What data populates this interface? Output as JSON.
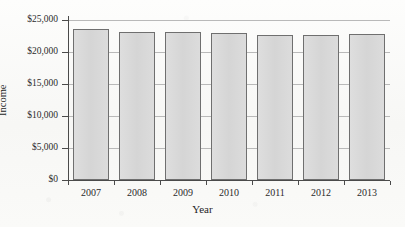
{
  "figure": {
    "cropped_header_text": "",
    "background_color": "#fbfbfa",
    "bar_fill_color": "#d9d9d9",
    "bar_border_color": "#6f6f6f",
    "gridline_color": "#b9b9b9",
    "axis_color": "#4a4a4a"
  },
  "chart_data": {
    "type": "bar",
    "title": "",
    "xlabel": "Year",
    "ylabel": "Income",
    "categories": [
      "2007",
      "2008",
      "2009",
      "2010",
      "2011",
      "2012",
      "2013"
    ],
    "values": [
      23600,
      23100,
      23200,
      22900,
      22700,
      22700,
      22800
    ],
    "ylim": [
      0,
      25000
    ],
    "ytick_values": [
      0,
      5000,
      10000,
      15000,
      20000,
      25000
    ],
    "ytick_labels": [
      "$0",
      "$5,000",
      "$10,000",
      "$15,000",
      "$20,000",
      "$25,000"
    ],
    "grid": true,
    "grid_axis": "y",
    "legend": false,
    "legend_position": "none"
  }
}
